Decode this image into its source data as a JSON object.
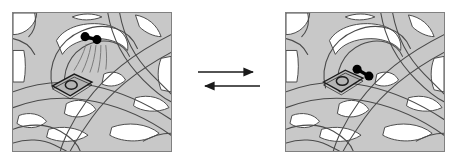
{
  "figure": {
    "kind": "chemical-equilibrium-diagram",
    "caption_text": "",
    "left_panel_label": "unbound state",
    "right_panel_label": "bound state",
    "equilibrium_symbol": "⇌",
    "forward_arrow_label": "forward",
    "reverse_arrow_label": "reverse"
  },
  "colors": {
    "framework_fill": "#c8c8c8",
    "framework_stroke": "#4a4a4a",
    "panel_border": "#808080",
    "panel_background": "#ffffff",
    "void_fill": "#ffffff",
    "molecule_fill": "#000000",
    "site_fill": "#b4b4b4",
    "site_stroke": "#1a1a1a",
    "trajectory_stroke": "#7a7a7a",
    "arrow_color": "#1a1a1a"
  },
  "left_panel": {
    "name": "unbound-state-panel",
    "molecule": {
      "name": "diatomic-molecule",
      "atom_count": 2,
      "atoms": [
        {
          "cx": 73,
          "cy": 24,
          "r": 4.6
        },
        {
          "cx": 85,
          "cy": 27,
          "r": 4.6
        }
      ],
      "bond": {
        "x1": 73,
        "y1": 24,
        "x2": 85,
        "y2": 27
      }
    },
    "binding_site": {
      "name": "binding-site-diamond",
      "center_x": 58,
      "center_y": 72,
      "occupied": false
    },
    "trajectory": {
      "name": "approach-trajectory",
      "stroke_count": 5,
      "direction": "downward-left"
    }
  },
  "right_panel": {
    "name": "bound-state-panel",
    "molecule": {
      "name": "diatomic-molecule",
      "atom_count": 2,
      "atoms": [
        {
          "cx": 72,
          "cy": 57,
          "r": 4.6
        },
        {
          "cx": 84,
          "cy": 64,
          "r": 4.6
        }
      ],
      "bond": {
        "x1": 72,
        "y1": 57,
        "x2": 84,
        "y2": 64
      }
    },
    "binding_site": {
      "name": "binding-site-diamond",
      "center_x": 58,
      "center_y": 68,
      "occupied": true
    },
    "trajectory": null
  }
}
